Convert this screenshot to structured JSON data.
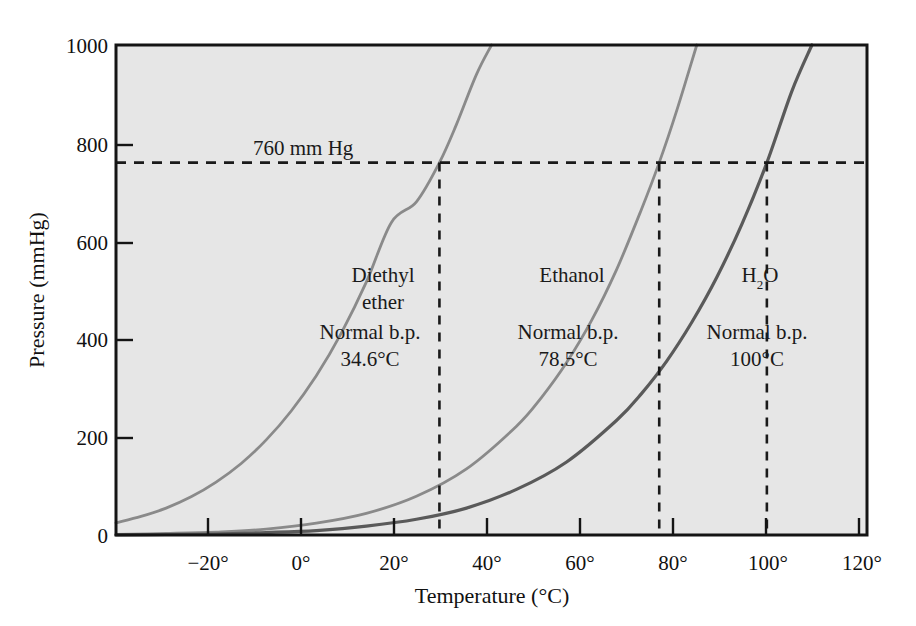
{
  "chart_data": {
    "type": "line",
    "title": "",
    "xlabel": "Temperature (°C)",
    "ylabel": "Pressure (mmHg)",
    "xlim": [
      -30,
      120
    ],
    "ylim": [
      0,
      1000
    ],
    "grid": false,
    "legend_position": "inline-annotations",
    "plot_background": "#e6e6e6",
    "x_ticks": [
      {
        "value": -20,
        "label": "−20°"
      },
      {
        "value": 0,
        "label": "0°"
      },
      {
        "value": 20,
        "label": "20°"
      },
      {
        "value": 40,
        "label": "40°"
      },
      {
        "value": 60,
        "label": "60°"
      },
      {
        "value": 80,
        "label": "80°"
      },
      {
        "value": 100,
        "label": "100°"
      },
      {
        "value": 120,
        "label": "120°"
      }
    ],
    "y_ticks": [
      {
        "value": 0,
        "label": "0"
      },
      {
        "value": 200,
        "label": "200"
      },
      {
        "value": 400,
        "label": "400"
      },
      {
        "value": 600,
        "label": "600"
      },
      {
        "value": 800,
        "label": "800"
      },
      {
        "value": 1000,
        "label": "1000"
      }
    ],
    "reference_line": {
      "label": "760 mm Hg",
      "value": 760,
      "orientation": "horizontal",
      "style": "dashed",
      "color": "#1a1a1a"
    },
    "series": [
      {
        "name": "Diethyl ether",
        "color": "#8a8a8a",
        "normal_boiling_point_c": 34.6,
        "boiling_point_label": "34.6°C",
        "points": [
          [
            -30,
            25
          ],
          [
            -25,
            38
          ],
          [
            -20,
            55
          ],
          [
            -15,
            78
          ],
          [
            -10,
            108
          ],
          [
            -5,
            146
          ],
          [
            0,
            194
          ],
          [
            5,
            253
          ],
          [
            10,
            325
          ],
          [
            15,
            412
          ],
          [
            20,
            516
          ],
          [
            25,
            638
          ],
          [
            30,
            680
          ],
          [
            34.6,
            760
          ],
          [
            38,
            838
          ],
          [
            42,
            940
          ],
          [
            45,
            1000
          ]
        ]
      },
      {
        "name": "Ethanol",
        "color": "#8a8a8a",
        "normal_boiling_point_c": 78.5,
        "boiling_point_label": "78.5°C",
        "points": [
          [
            -30,
            1
          ],
          [
            -20,
            3
          ],
          [
            -10,
            6
          ],
          [
            0,
            12
          ],
          [
            10,
            24
          ],
          [
            20,
            44
          ],
          [
            30,
            79
          ],
          [
            40,
            135
          ],
          [
            50,
            222
          ],
          [
            55,
            281
          ],
          [
            60,
            352
          ],
          [
            65,
            438
          ],
          [
            70,
            542
          ],
          [
            75,
            666
          ],
          [
            78.5,
            760
          ],
          [
            82,
            866
          ],
          [
            86,
            1000
          ]
        ]
      },
      {
        "name": "H2O",
        "color": "#5a5a5a",
        "normal_boiling_point_c": 100,
        "boiling_point_label": "100°C",
        "points": [
          [
            -30,
            0.4
          ],
          [
            -20,
            1
          ],
          [
            -10,
            2
          ],
          [
            0,
            5
          ],
          [
            10,
            9
          ],
          [
            20,
            18
          ],
          [
            30,
            32
          ],
          [
            40,
            55
          ],
          [
            50,
            93
          ],
          [
            60,
            149
          ],
          [
            70,
            234
          ],
          [
            75,
            289
          ],
          [
            80,
            355
          ],
          [
            85,
            434
          ],
          [
            90,
            526
          ],
          [
            95,
            634
          ],
          [
            100,
            760
          ],
          [
            105,
            906
          ],
          [
            109,
            1000
          ]
        ]
      }
    ],
    "annotations": [
      {
        "id": "diethyl-ether",
        "lines": [
          "Diethyl",
          "ether",
          "Normal b.p.",
          "34.6°C"
        ],
        "name_line_1": "Diethyl",
        "name_line_2": "ether",
        "bp_caption": "Normal b.p.",
        "bp_value": "34.6°C"
      },
      {
        "id": "ethanol",
        "lines": [
          "Ethanol",
          "Normal b.p.",
          "78.5°C"
        ],
        "name_line_1": "Ethanol",
        "bp_caption": "Normal b.p.",
        "bp_value": "78.5°C"
      },
      {
        "id": "water",
        "lines": [
          "H2O",
          "Normal b.p.",
          "100°C"
        ],
        "name_main": "H",
        "name_sub": "2",
        "name_tail": "O",
        "bp_caption": "Normal b.p.",
        "bp_value": "100°C"
      }
    ]
  }
}
